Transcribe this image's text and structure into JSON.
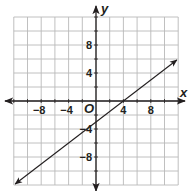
{
  "chart_data": {
    "type": "line",
    "title": "",
    "xlabel": "x",
    "ylabel": "y",
    "origin_label": "O",
    "xlim": [
      -12,
      12
    ],
    "ylim": [
      -12,
      12
    ],
    "grid": true,
    "grid_step": 2,
    "x_ticks": [
      {
        "value": -8,
        "label": "−8"
      },
      {
        "value": -4,
        "label": "−4"
      },
      {
        "value": 4,
        "label": "4"
      },
      {
        "value": 8,
        "label": "8"
      }
    ],
    "y_ticks": [
      {
        "value": 8,
        "label": "8"
      },
      {
        "value": 4,
        "label": "4"
      },
      {
        "value": -4,
        "label": "−4"
      },
      {
        "value": -8,
        "label": "−8"
      }
    ],
    "series": [
      {
        "name": "line",
        "equation": "y = 3/4 x - 3",
        "slope": 0.75,
        "y_intercept": -3,
        "x_intercept": 4,
        "x": [
          -11.8,
          0,
          4,
          11.8
        ],
        "y": [
          -11.85,
          -3,
          0,
          5.85
        ],
        "arrows": "both"
      }
    ],
    "colors": {
      "line": "#231f20",
      "grid": "#b9b9b9",
      "axis": "#231f20"
    }
  }
}
